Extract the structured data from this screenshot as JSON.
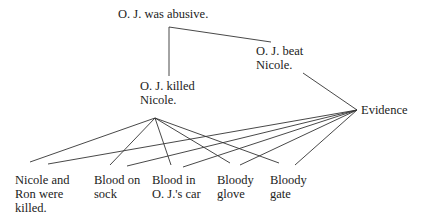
{
  "diagram": {
    "type": "argument-tree",
    "nodes": {
      "root": {
        "line1": "O. J. was abusive.",
        "x": 118,
        "y": 7
      },
      "killed": {
        "line1": "O. J. killed",
        "line2": "Nicole.",
        "x": 140,
        "y": 79
      },
      "beat": {
        "line1": "O.  J. beat",
        "line2": "Nicole.",
        "x": 256,
        "y": 44
      },
      "evidence": {
        "line1": "Evidence",
        "x": 361,
        "y": 103
      },
      "e1": {
        "line1": "Nicole and",
        "line2": "Ron were",
        "line3": "killed.",
        "x": 15,
        "y": 173
      },
      "e2": {
        "line1": "Blood on",
        "line2": "sock",
        "x": 94,
        "y": 173
      },
      "e3": {
        "line1": "Blood in",
        "line2": "O. J.'s car",
        "x": 152,
        "y": 173
      },
      "e4": {
        "line1": "Bloody",
        "line2": "glove",
        "x": 217,
        "y": 173
      },
      "e5": {
        "line1": "Bloody",
        "line2": "gate",
        "x": 270,
        "y": 173
      }
    },
    "edges": [
      {
        "from": "root",
        "to": "killed",
        "x1": 169,
        "y1": 27,
        "x2": 169,
        "y2": 76
      },
      {
        "from": "root",
        "to": "beat",
        "x1": 169,
        "y1": 27,
        "x2": 271,
        "y2": 42
      },
      {
        "from": "beat",
        "to": "evidence",
        "x1": 303,
        "y1": 73,
        "x2": 357,
        "y2": 110
      },
      {
        "from": "killed",
        "to": "e1",
        "x1": 155,
        "y1": 118,
        "x2": 30,
        "y2": 162
      },
      {
        "from": "killed",
        "to": "e2",
        "x1": 155,
        "y1": 118,
        "x2": 110,
        "y2": 165
      },
      {
        "from": "killed",
        "to": "e3",
        "x1": 155,
        "y1": 118,
        "x2": 171,
        "y2": 165
      },
      {
        "from": "killed",
        "to": "e4",
        "x1": 155,
        "y1": 118,
        "x2": 230,
        "y2": 163
      },
      {
        "from": "killed",
        "to": "e5",
        "x1": 155,
        "y1": 118,
        "x2": 279,
        "y2": 163
      },
      {
        "from": "evidence",
        "to": "e1",
        "x1": 357,
        "y1": 110,
        "x2": 48,
        "y2": 164
      },
      {
        "from": "evidence",
        "to": "e2",
        "x1": 357,
        "y1": 110,
        "x2": 127,
        "y2": 166
      },
      {
        "from": "evidence",
        "to": "e3",
        "x1": 357,
        "y1": 110,
        "x2": 183,
        "y2": 167
      },
      {
        "from": "evidence",
        "to": "e4",
        "x1": 357,
        "y1": 110,
        "x2": 240,
        "y2": 165
      },
      {
        "from": "evidence",
        "to": "e5",
        "x1": 357,
        "y1": 110,
        "x2": 295,
        "y2": 165
      }
    ],
    "line_color": "#333333"
  }
}
